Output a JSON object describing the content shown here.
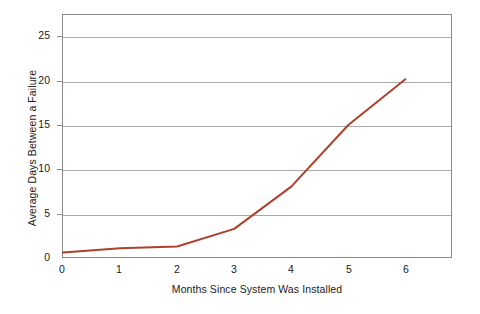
{
  "chart_data": {
    "type": "line",
    "title": "",
    "subtitle": "",
    "xlabel": "Months Since System Was Installed",
    "ylabel": "Average Days Between a Failure",
    "x": [
      0,
      1,
      2,
      3,
      4,
      5,
      6
    ],
    "values": [
      0.5,
      1.0,
      1.2,
      3.2,
      8.0,
      15.0,
      20.2
    ],
    "series": [
      {
        "name": "Average Days Between a Failure",
        "values": [
          0.5,
          1.0,
          1.2,
          3.2,
          8.0,
          15.0,
          20.2
        ],
        "color": "#B0402C"
      }
    ],
    "xlim": [
      0,
      6.8
    ],
    "ylim": [
      0,
      27.5
    ],
    "x_ticks": [
      0,
      1,
      2,
      3,
      4,
      5,
      6
    ],
    "x_tick_labels": [
      "0",
      "1",
      "2",
      "3",
      "4",
      "5",
      "6"
    ],
    "y_ticks": [
      5,
      10,
      15,
      20,
      25
    ],
    "y_tick_labels": [
      "5",
      "10",
      "15",
      "20",
      "25"
    ],
    "y_origin_label": "0",
    "grid": "horizontal",
    "legend": "none",
    "marker": "none",
    "line_width": 2
  },
  "axes": {
    "x_title": "Months Since System Was Installed",
    "y_title": "Average Days Between a Failure"
  },
  "colors": {
    "line": "#B0402C",
    "grid": "#a9a9a9",
    "frame": "#8a8a8a",
    "text": "#1a1a1a",
    "background": "#ffffff"
  }
}
